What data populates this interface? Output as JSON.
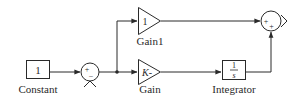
{
  "diagram": {
    "type": "simulink-block-diagram",
    "blocks": {
      "constant": {
        "value": "1",
        "label": "Constant"
      },
      "sum1": {
        "signs": [
          "+",
          "−"
        ]
      },
      "gain1": {
        "value": "1",
        "label": "Gain1"
      },
      "gain": {
        "value": "K-",
        "label": "Gain"
      },
      "integrator": {
        "numerator": "1",
        "denominator": "s",
        "label": "Integrator"
      },
      "sum2": {
        "signs": [
          "+",
          "+"
        ]
      }
    },
    "connections": [
      {
        "from": "constant",
        "to": "sum1 (+)"
      },
      {
        "from": "sum1",
        "to": "branch"
      },
      {
        "from": "branch",
        "to": "gain1"
      },
      {
        "from": "branch",
        "to": "gain"
      },
      {
        "from": "gain1",
        "to": "sum2 (+ left)"
      },
      {
        "from": "gain",
        "to": "integrator"
      },
      {
        "from": "integrator",
        "to": "sum2 (+ bottom)"
      }
    ],
    "colors": {
      "line": "#2a2a2a",
      "background": "#ffffff"
    }
  }
}
